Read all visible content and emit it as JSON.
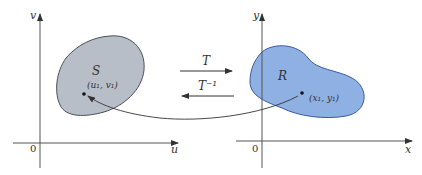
{
  "diagram": {
    "type": "change-of-variables transformation",
    "left_plane": {
      "vertical_axis_label": "v",
      "horizontal_axis_label": "u",
      "origin_label": "0",
      "region": {
        "label": "S",
        "point_label": "(u₁, v₁)",
        "fill_color": "#b8bec8",
        "stroke_color": "#4a4f58"
      }
    },
    "right_plane": {
      "vertical_axis_label": "y",
      "horizontal_axis_label": "x",
      "origin_label": "0",
      "region": {
        "label": "R",
        "point_label": "(x₁, y₁)",
        "fill_color": "#8fb0e2",
        "stroke_color": "#3a5aa0"
      }
    },
    "transform": {
      "forward_label": "T",
      "inverse_label": "T⁻¹"
    },
    "colors": {
      "axis": "#555555",
      "text": "#333333"
    }
  }
}
